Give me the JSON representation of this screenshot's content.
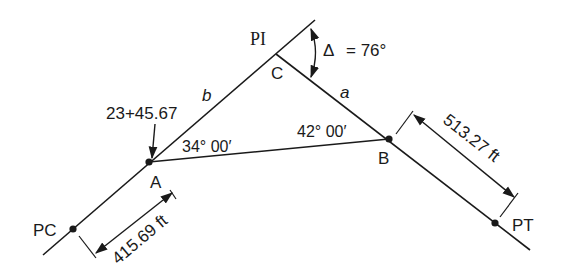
{
  "diagram": {
    "points": {
      "PI": {
        "label": "PI"
      },
      "C": {
        "label": "C"
      },
      "A": {
        "label": "A"
      },
      "B": {
        "label": "B"
      },
      "PC": {
        "label": "PC"
      },
      "PT": {
        "label": "PT"
      }
    },
    "sides": {
      "b": "b",
      "a": "a"
    },
    "station": "23+45.67",
    "delta": {
      "symbol": "Δ",
      "text": "= 76°"
    },
    "angle_A": "34° 00′",
    "angle_B": "42° 00′",
    "dim_PC_A": "415.69 ft",
    "dim_B_PT": "513.27 ft",
    "colors": {
      "line": "#1a1a1a",
      "background": "#ffffff"
    }
  }
}
